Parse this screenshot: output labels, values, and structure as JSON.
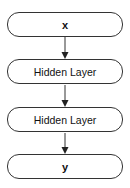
{
  "diagram": {
    "nodes": [
      {
        "id": "x",
        "label": "x",
        "bold": true
      },
      {
        "id": "h1",
        "label": "Hidden Layer",
        "bold": false
      },
      {
        "id": "h2",
        "label": "Hidden Layer",
        "bold": false
      },
      {
        "id": "y",
        "label": "y",
        "bold": true
      }
    ],
    "edges": [
      {
        "from": "x",
        "to": "h1"
      },
      {
        "from": "h1",
        "to": "h2"
      },
      {
        "from": "h2",
        "to": "y"
      }
    ],
    "colors": {
      "stroke": "#333333",
      "fill": "#ffffff",
      "text": "#111111"
    }
  }
}
